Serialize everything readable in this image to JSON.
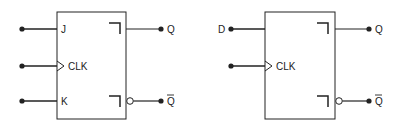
{
  "diagram": {
    "colors": {
      "stroke": "#222222",
      "background": "#ffffff"
    },
    "flipflops": [
      {
        "type": "JK",
        "inputs": [
          {
            "label": "J",
            "pin": "data"
          },
          {
            "label": "CLK",
            "pin": "clock",
            "edge_triangle": true
          },
          {
            "label": "K",
            "pin": "data"
          }
        ],
        "outputs": [
          {
            "label": "Q",
            "inverted": false
          },
          {
            "label": "Q",
            "inverted": true,
            "overbar": true
          }
        ]
      },
      {
        "type": "D",
        "inputs": [
          {
            "label": "D",
            "pin": "data",
            "label_outside": true
          },
          {
            "label": "CLK",
            "pin": "clock",
            "edge_triangle": true
          }
        ],
        "outputs": [
          {
            "label": "Q",
            "inverted": false
          },
          {
            "label": "Q",
            "inverted": true,
            "overbar": true
          }
        ]
      }
    ]
  }
}
